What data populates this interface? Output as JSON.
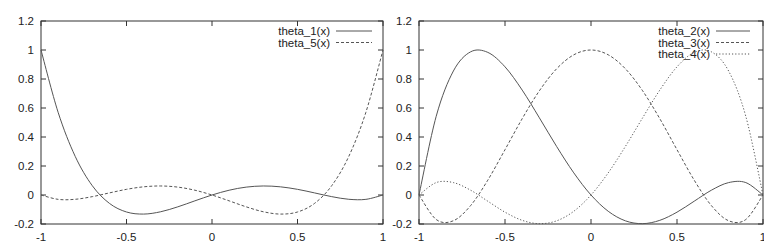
{
  "x_grid": [
    -1,
    -0.9,
    -0.8,
    -0.7,
    -0.6,
    -0.5,
    -0.4,
    -0.3,
    -0.2,
    -0.1,
    0,
    0.1,
    0.2,
    0.3,
    0.4,
    0.5,
    0.6,
    0.7,
    0.8,
    0.9,
    1
  ],
  "chart_data": [
    {
      "type": "line",
      "title": "",
      "xlabel": "",
      "ylabel": "",
      "xlim": [
        -1,
        1
      ],
      "ylim": [
        -0.2,
        1.2
      ],
      "xticks": [
        "-1",
        "-0.5",
        "0",
        "0.5",
        "1"
      ],
      "yticks": [
        "-0.2",
        "0",
        "0.2",
        "0.4",
        "0.6",
        "0.8",
        "1",
        "1.2"
      ],
      "grid": false,
      "legend_position": "top-right",
      "x": [
        -1,
        -0.9,
        -0.8,
        -0.7,
        -0.6,
        -0.5,
        -0.4,
        -0.3,
        -0.2,
        -0.1,
        0,
        0.1,
        0.2,
        0.3,
        0.4,
        0.5,
        0.6,
        0.7,
        0.8,
        0.9,
        1
      ],
      "series": [
        {
          "name": "theta_1(x)",
          "style": "solid",
          "values": [
            1.0,
            0.5707,
            0.2664,
            0.064,
            -0.0576,
            -0.1172,
            -0.1316,
            -0.1155,
            -0.0816,
            -0.0403,
            0,
            0.033,
            0.0544,
            0.0622,
            0.0564,
            0.0391,
            0.0144,
            -0.0113,
            -0.0296,
            -0.03,
            0
          ]
        },
        {
          "name": "theta_5(x)",
          "style": "dashed",
          "values": [
            0,
            -0.03,
            -0.0296,
            -0.0113,
            0.0144,
            0.0391,
            0.0564,
            0.0622,
            0.0544,
            0.033,
            0,
            -0.0403,
            -0.0816,
            -0.1155,
            -0.1316,
            -0.1172,
            -0.0576,
            0.064,
            0.2664,
            0.5707,
            1.0
          ]
        }
      ]
    },
    {
      "type": "line",
      "title": "",
      "xlabel": "",
      "ylabel": "",
      "xlim": [
        -1,
        1
      ],
      "ylim": [
        -0.2,
        1.2
      ],
      "xticks": [
        "-1",
        "-0.5",
        "0",
        "0.5",
        "1"
      ],
      "yticks": [
        "-0.2",
        "0",
        "0.2",
        "0.4",
        "0.6",
        "0.8",
        "1",
        "1.2"
      ],
      "grid": false,
      "legend_position": "top-right",
      "x": [
        -1,
        -0.9,
        -0.8,
        -0.7,
        -0.6,
        -0.5,
        -0.4,
        -0.3,
        -0.2,
        -0.1,
        0,
        0.1,
        0.2,
        0.3,
        0.4,
        0.5,
        0.6,
        0.7,
        0.8,
        0.9,
        1
      ],
      "series": [
        {
          "name": "theta_2(x)",
          "style": "solid",
          "values": [
            0,
            0.5428,
            0.8553,
            0.9874,
            0.9836,
            0.884,
            0.7235,
            0.5321,
            0.335,
            0.1525,
            0,
            -0.1121,
            -0.1782,
            -0.1977,
            -0.1747,
            -0.1184,
            -0.0428,
            0.0331,
            0.0855,
            0.0857,
            0
          ]
        },
        {
          "name": "theta_3(x)",
          "style": "dashed",
          "values": [
            0,
            -0.1691,
            -0.1776,
            -0.0731,
            0.1024,
            0.3125,
            0.5264,
            0.7189,
            0.8704,
            0.9669,
            1,
            0.9669,
            0.8704,
            0.7189,
            0.5264,
            0.3125,
            0.1024,
            -0.0731,
            -0.1776,
            -0.1691,
            0
          ]
        },
        {
          "name": "theta_4(x)",
          "style": "dotted",
          "values": [
            0,
            0.0857,
            0.0855,
            0.0331,
            -0.0428,
            -0.1184,
            -0.1747,
            -0.1977,
            -0.1782,
            -0.1121,
            0,
            0.1525,
            0.335,
            0.5321,
            0.7235,
            0.884,
            0.9836,
            0.9874,
            0.8553,
            0.5428,
            0
          ]
        }
      ]
    }
  ],
  "colors": {
    "line": "#555555",
    "axis": "#333333",
    "text": "#222222",
    "background": "#ffffff"
  }
}
